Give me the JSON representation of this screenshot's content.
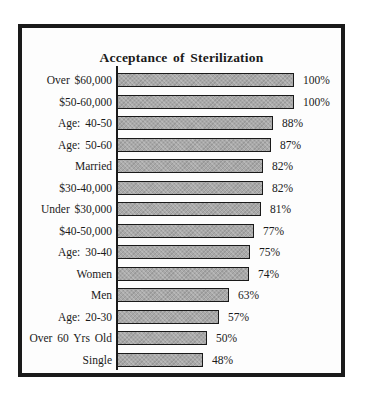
{
  "chart_data": {
    "type": "bar",
    "orientation": "horizontal",
    "title": "Acceptance of Sterilization",
    "xlabel": "",
    "ylabel": "",
    "xlim": [
      0,
      100
    ],
    "grid": false,
    "legend": null,
    "value_suffix": "%",
    "categories": [
      "Over $60,000",
      "$50-60,000",
      "Age: 40-50",
      "Age: 50-60",
      "Married",
      "$30-40,000",
      "Under $30,000",
      "$40-50,000",
      "Age: 30-40",
      "Women",
      "Men",
      "Age: 20-30",
      "Over 60 Yrs Old",
      "Single"
    ],
    "values": [
      100,
      100,
      88,
      87,
      82,
      82,
      81,
      77,
      75,
      74,
      63,
      57,
      50,
      48
    ],
    "value_labels": [
      "100%",
      "100%",
      "88%",
      "87%",
      "82%",
      "82%",
      "81%",
      "77%",
      "75%",
      "74%",
      "63%",
      "57%",
      "50%",
      "48%"
    ]
  },
  "colors": {
    "bar_fill": "#a9a9a9",
    "bar_border": "#1a1a1a",
    "frame_border": "#1a1a1a",
    "background": "#ffffff"
  }
}
